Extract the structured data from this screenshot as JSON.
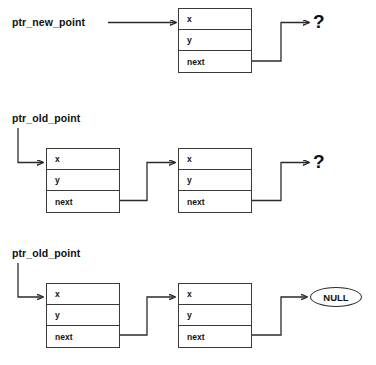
{
  "diagram": {
    "node_fields": [
      "x",
      "y",
      "next"
    ],
    "colors": {
      "stroke": "#2b2b2b",
      "box_border": "#3a3a3a",
      "text": "#111111",
      "background": "#ffffff"
    },
    "rows": [
      {
        "id": "row-new-node",
        "pointer_label": "ptr_new_point",
        "nodes": [
          {
            "id": "new-node",
            "fields": [
              "x",
              "y",
              "next"
            ]
          }
        ],
        "terminator": {
          "type": "question-mark",
          "label": "?"
        }
      },
      {
        "id": "row-old-list-unterminated",
        "pointer_label": "ptr_old_point",
        "nodes": [
          {
            "id": "old-node-1",
            "fields": [
              "x",
              "y",
              "next"
            ]
          },
          {
            "id": "old-node-2",
            "fields": [
              "x",
              "y",
              "next"
            ]
          }
        ],
        "terminator": {
          "type": "question-mark",
          "label": "?"
        }
      },
      {
        "id": "row-old-list-terminated",
        "pointer_label": "ptr_old_point",
        "nodes": [
          {
            "id": "old-node-3",
            "fields": [
              "x",
              "y",
              "next"
            ]
          },
          {
            "id": "old-node-4",
            "fields": [
              "x",
              "y",
              "next"
            ]
          }
        ],
        "terminator": {
          "type": "null-ellipse",
          "label": "NULL"
        }
      }
    ]
  }
}
